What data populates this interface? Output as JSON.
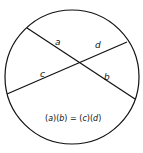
{
  "diagram": {
    "type": "intersecting-chords-theorem",
    "circle": {
      "cx": 72,
      "cy": 77,
      "r": 67
    },
    "chords": [
      {
        "name": "chord-ab",
        "x1": 27,
        "y1": 28,
        "x2": 135,
        "y2": 99
      },
      {
        "name": "chord-cd",
        "x1": 7,
        "y1": 94,
        "x2": 127,
        "y2": 42
      }
    ],
    "labels": {
      "a": "a",
      "b": "b",
      "c": "c",
      "d": "d"
    },
    "equation": {
      "p1": "(",
      "a": "a",
      "p2": ")(",
      "b": "b",
      "p3": ") = (",
      "c": "c",
      "p4": ")(",
      "d": "d",
      "p5": ")"
    },
    "colors": {
      "stroke": "#111111",
      "background": "#ffffff"
    }
  }
}
